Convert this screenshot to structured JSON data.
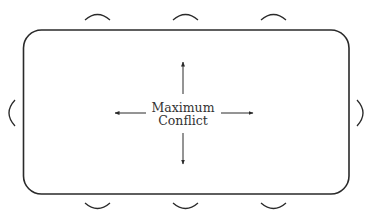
{
  "diagram": {
    "center_label": {
      "line1": "Maximum",
      "line2": "Conflict"
    },
    "arrows": [
      "up",
      "down",
      "left",
      "right"
    ],
    "table": {
      "shape": "rounded-rectangle"
    },
    "seats": {
      "top": 3,
      "bottom": 3,
      "left": 1,
      "right": 1
    },
    "colors": {
      "stroke": "#2a2a2a",
      "background": "#ffffff",
      "text": "#333333"
    }
  }
}
